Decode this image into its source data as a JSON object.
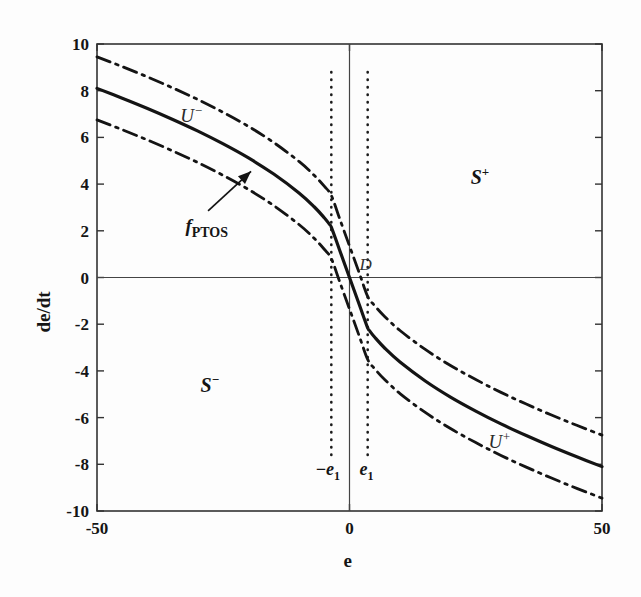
{
  "figure": {
    "background": "#fdfdfd",
    "ink_color": "#151515",
    "frame_color": "#333333"
  },
  "chart_data": {
    "type": "line",
    "title": "",
    "subtitle": "",
    "xlabel": "e",
    "ylabel": "de/dt",
    "xlim": [
      -50,
      50
    ],
    "ylim": [
      -10,
      10
    ],
    "xticks": [
      -50,
      0,
      50
    ],
    "xticklabels": [
      "-50",
      "0",
      "50"
    ],
    "yticks": [
      -10,
      -8,
      -6,
      -4,
      -2,
      0,
      2,
      4,
      6,
      8,
      10
    ],
    "yticklabels": [
      "-10",
      "-8",
      "-6",
      "-4",
      "-2",
      "0",
      "2",
      "4",
      "6",
      "8",
      "10"
    ],
    "grid": false,
    "legend": "none",
    "axis_lines": {
      "x_zero": true,
      "y_zero": true
    },
    "series": [
      {
        "name": "f_PTOS",
        "style": "solid",
        "linewidth": 3.2,
        "color": "#141414",
        "x": [
          -50,
          -45,
          -40,
          -35,
          -30,
          -25,
          -20,
          -15,
          -10,
          -7,
          -5,
          -4,
          -3.6,
          -2,
          0,
          2,
          3.6,
          4,
          5,
          7,
          10,
          15,
          20,
          25,
          30,
          35,
          40,
          45,
          50
        ],
        "y": [
          8.1,
          7.68,
          7.24,
          6.77,
          6.27,
          5.72,
          5.12,
          4.43,
          3.62,
          3.03,
          2.56,
          2.29,
          2.16,
          1.2,
          0.0,
          -1.2,
          -2.16,
          -2.29,
          -2.56,
          -3.03,
          -3.62,
          -4.43,
          -5.12,
          -5.72,
          -6.27,
          -6.77,
          -7.24,
          -7.68,
          -8.1
        ]
      },
      {
        "name": "U-",
        "style": "dashdot",
        "linewidth": 2.8,
        "color": "#141414",
        "offset": 1.35,
        "x": [
          -50,
          -45,
          -40,
          -35,
          -30,
          -25,
          -20,
          -15,
          -10,
          -7,
          -5,
          -3.6,
          -2,
          0,
          2,
          3.6,
          5,
          7,
          10,
          15,
          20,
          25,
          30,
          35,
          40,
          45,
          50
        ],
        "y": [
          9.45,
          9.03,
          8.59,
          8.12,
          7.62,
          7.07,
          6.47,
          5.78,
          4.97,
          4.38,
          3.91,
          3.51,
          2.55,
          1.35,
          0.15,
          -0.81,
          -1.21,
          -1.68,
          -2.27,
          -3.08,
          -3.77,
          -4.37,
          -4.92,
          -5.42,
          -5.89,
          -6.33,
          -6.75
        ]
      },
      {
        "name": "U+",
        "style": "dashdot",
        "linewidth": 2.8,
        "color": "#141414",
        "offset": -1.35,
        "x": [
          -50,
          -45,
          -40,
          -35,
          -30,
          -25,
          -20,
          -15,
          -10,
          -7,
          -5,
          -3.6,
          -2,
          0,
          2,
          3.6,
          5,
          7,
          10,
          15,
          20,
          25,
          30,
          35,
          40,
          45,
          50
        ],
        "y": [
          6.75,
          6.33,
          5.89,
          5.42,
          4.92,
          4.37,
          3.77,
          3.08,
          2.27,
          1.68,
          1.21,
          0.81,
          -0.15,
          -1.35,
          -2.55,
          -3.51,
          -3.91,
          -4.38,
          -4.97,
          -5.78,
          -6.47,
          -7.07,
          -7.62,
          -8.12,
          -8.59,
          -9.03,
          -9.45
        ]
      }
    ],
    "vlines": [
      {
        "name": "-e1",
        "x": -3.6,
        "style": "dotted",
        "y_from": -7.6,
        "y_to": 8.8
      },
      {
        "name": "e1",
        "x": 3.6,
        "style": "dotted",
        "y_from": -7.6,
        "y_to": 8.8
      }
    ],
    "annotations": [
      {
        "name": "region-s-plus",
        "text": "S",
        "sup": "+",
        "x": 24,
        "y": 4.3
      },
      {
        "name": "region-s-minus",
        "text": "S",
        "sup": "−",
        "x": -29.5,
        "y": -4.6
      },
      {
        "name": "curve-u-minus",
        "text": "U",
        "sup": "−",
        "x": -33.5,
        "y": 6.95
      },
      {
        "name": "curve-u-plus",
        "text": "U",
        "sup": "+",
        "x": 27.5,
        "y": -7.0
      },
      {
        "name": "fptos-label",
        "text": "f",
        "sub": "PTOS",
        "x": -32.5,
        "y": 2.1
      },
      {
        "name": "origin-d-label",
        "text": "D",
        "x": 2.0,
        "y": 0.45
      },
      {
        "name": "threshold-neg",
        "text": "−e",
        "sub": "1",
        "x": -6.8,
        "y": -8.3
      },
      {
        "name": "threshold-pos",
        "text": "e",
        "sub": "1",
        "x": 2.0,
        "y": -8.3
      }
    ],
    "arrow": {
      "name": "fptos-pointer",
      "from_x": -28.0,
      "from_y": 2.85,
      "to_x": -19.5,
      "to_y": 4.55
    }
  },
  "labels": {
    "xlabel": "e",
    "ylabel": "de/dt",
    "s_plus": "S",
    "s_plus_sup": "+",
    "s_minus": "S",
    "s_minus_sup": "−",
    "u_minus": "U",
    "u_minus_sup": "−",
    "u_plus": "U",
    "u_plus_sup": "+",
    "fptos": "f",
    "fptos_sub": "PTOS",
    "d_label": "D",
    "neg_e1": "−e",
    "neg_e1_sub": "1",
    "pos_e1": "e",
    "pos_e1_sub": "1"
  }
}
